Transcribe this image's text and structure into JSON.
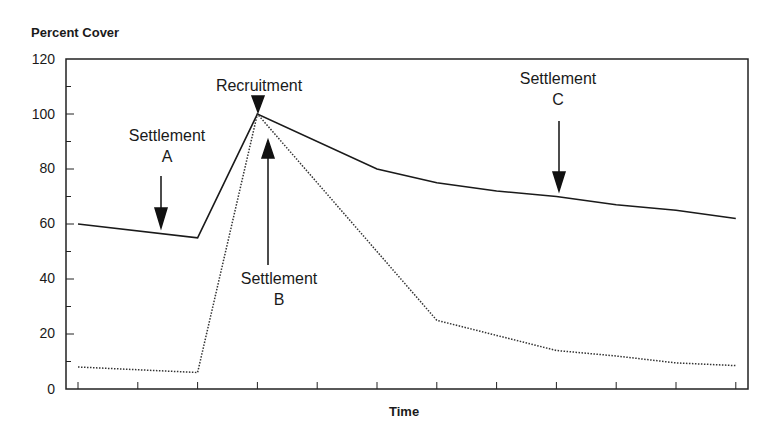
{
  "chart_data": {
    "type": "line",
    "title": "",
    "xlabel": "Time",
    "ylabel": "Percent Cover",
    "ylim": [
      0,
      120
    ],
    "yticks": [
      0,
      20,
      40,
      60,
      80,
      100,
      120
    ],
    "x": [
      0,
      1,
      2,
      3,
      4,
      5,
      6,
      7,
      8,
      9,
      10,
      11
    ],
    "xtick_labels": [],
    "grid": false,
    "legend": null,
    "series": [
      {
        "name": "solid",
        "style": "solid",
        "x": [
          0,
          2,
          3,
          5,
          6,
          7,
          8,
          9,
          10,
          11
        ],
        "values": [
          60,
          55,
          100,
          80,
          75,
          72,
          70,
          67,
          65,
          62
        ]
      },
      {
        "name": "dotted",
        "style": "dotted",
        "x": [
          0,
          2,
          3,
          6,
          7,
          8,
          9,
          10,
          11
        ],
        "values": [
          8,
          6,
          100,
          25,
          19.5,
          14,
          12,
          9.5,
          8.5
        ]
      }
    ],
    "annotations": [
      {
        "text": "Recruitment",
        "x": 3,
        "arrow": "down",
        "target_y": 100
      },
      {
        "text": "Settlement A",
        "x": 1.4,
        "arrow": "down",
        "target_y": 57
      },
      {
        "text": "Settlement B",
        "x": 3.15,
        "arrow": "up",
        "target_y": 90
      },
      {
        "text": "Settlement C",
        "x": 8.05,
        "arrow": "down",
        "target_y": 72
      }
    ]
  },
  "labels": {
    "ylabel": "Percent Cover",
    "xlabel": "Time",
    "yticks": [
      "0",
      "20",
      "40",
      "60",
      "80",
      "100",
      "120"
    ],
    "recruitment": "Recruitment",
    "settlement": "Settlement",
    "a": "A",
    "b": "B",
    "c": "C"
  }
}
